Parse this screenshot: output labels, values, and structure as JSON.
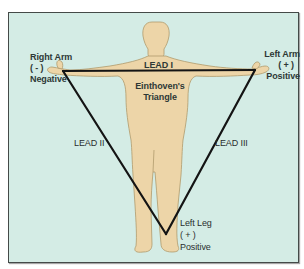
{
  "diagram": {
    "title": "Einthoven's Triangle",
    "title_lines": [
      "Einthoven's",
      "Triangle"
    ],
    "colors": {
      "background": "#d4ece5",
      "border": "#444a48",
      "body_fill": "#edd5a8",
      "body_outline": "#b09a6c",
      "lead_line": "#141414",
      "text": "#2e3836"
    },
    "electrodes": {
      "right_arm": {
        "name": "Right Arm",
        "polarity": "( - )",
        "sign": "Negative"
      },
      "left_arm": {
        "name": "Left Arm",
        "polarity": "( + )",
        "sign": "Positive"
      },
      "left_leg": {
        "name": "Left Leg",
        "polarity": "( + )",
        "sign": "Positive"
      }
    },
    "leads": {
      "lead_1": "LEAD I",
      "lead_2": "LEAD II",
      "lead_3": "LEAD III"
    },
    "vertices": {
      "right_arm": [
        63,
        71
      ],
      "left_arm": [
        255,
        70
      ],
      "left_leg": [
        166,
        234
      ]
    }
  }
}
